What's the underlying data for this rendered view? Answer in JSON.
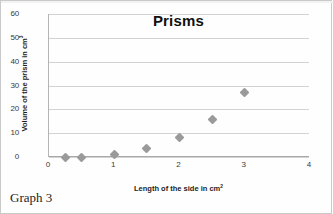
{
  "chart_data": {
    "type": "scatter",
    "title": "Prisms",
    "xlabel": "Length of the side in cm",
    "xlabel_sup": "2",
    "ylabel": "Volume of the prism in cm",
    "ylabel_sup": "3",
    "xlim": [
      0,
      4
    ],
    "ylim": [
      0,
      60
    ],
    "grid": true,
    "grid_axis": "y",
    "legend": null,
    "marker": "diamond",
    "marker_color": "#9a9a9a",
    "xticks": [
      "0",
      "1",
      "2",
      "3",
      "4"
    ],
    "xtick_values": [
      0,
      1,
      2,
      3,
      4
    ],
    "yticks": [
      "0",
      "10",
      "20",
      "30",
      "40",
      "50",
      "60"
    ],
    "ytick_values": [
      0,
      10,
      20,
      30,
      40,
      50,
      60
    ],
    "x": [
      0.25,
      0.5,
      1,
      1.5,
      2,
      2.5,
      3
    ],
    "y": [
      0,
      0,
      1,
      3.4,
      8,
      15.6,
      27
    ],
    "points": [
      {
        "x": 0.25,
        "y": 0
      },
      {
        "x": 0.5,
        "y": 0
      },
      {
        "x": 1,
        "y": 1
      },
      {
        "x": 1.5,
        "y": 3.4
      },
      {
        "x": 2,
        "y": 8
      },
      {
        "x": 2.5,
        "y": 15.6
      },
      {
        "x": 3,
        "y": 27
      }
    ]
  },
  "caption": {
    "text": "Graph 3"
  }
}
